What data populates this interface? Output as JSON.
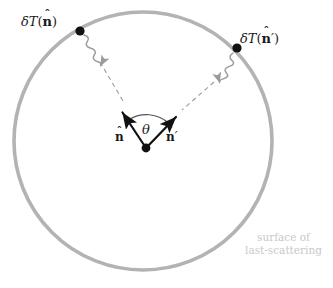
{
  "figure": {
    "background_color": "#ffffff",
    "width": 333,
    "height": 288
  },
  "colors": {
    "circle_stroke": "#b3b3b3",
    "photon_wave": "#9b9b9b",
    "dashed_line": "#9b9b9b",
    "vector_black": "#111111",
    "dot_black": "#111111",
    "caption_gray": "#c8c8c8",
    "arc_gray": "#555555"
  },
  "circle": {
    "name": "last-scattering-surface",
    "center_x": 143,
    "center_y": 141,
    "radius": 129,
    "stroke_width": 3.6
  },
  "observer": {
    "label": "observer-origin",
    "x": 146,
    "y": 148,
    "dot_radius": 4.2
  },
  "labels": {
    "delta_t_left": {
      "delta": "δ",
      "t": "T",
      "open_paren": "(",
      "vector": "n",
      "hat": "ˆ",
      "prime": "",
      "close_paren": ")"
    },
    "delta_t_right": {
      "delta": "δ",
      "t": "T",
      "open_paren": "(",
      "vector": "n",
      "hat": "ˆ",
      "prime": "′",
      "close_paren": ")"
    },
    "n_hat": {
      "vector": "n",
      "hat": "ˆ",
      "prime": ""
    },
    "n_hat_prime": {
      "vector": "n",
      "hat": "ˆ",
      "prime": "′"
    },
    "theta": "θ"
  },
  "caption": {
    "line1": "surface of",
    "line2": "last-scattering"
  },
  "points": [
    {
      "name": "scattering-point-left",
      "x": 80,
      "y": 31,
      "dot_radius": 4.4,
      "label": "δT(n̂)"
    },
    {
      "name": "scattering-point-right",
      "x": 237,
      "y": 48,
      "dot_radius": 4.4,
      "label": "δT(n̂′)"
    }
  ],
  "vectors": [
    {
      "name": "n-hat-vector",
      "from_x": 146,
      "from_y": 148,
      "to_x": 121,
      "to_y": 110,
      "label": "n̂",
      "color": "#111111"
    },
    {
      "name": "n-hat-prime-vector",
      "from_x": 146,
      "from_y": 148,
      "to_x": 178,
      "to_y": 115,
      "label": "n̂′",
      "color": "#111111"
    }
  ],
  "dashed_lines": [
    {
      "name": "sightline-left",
      "from_x": 100,
      "from_y": 62,
      "to_x": 124,
      "to_y": 103
    },
    {
      "name": "sightline-right",
      "from_x": 214,
      "from_y": 82,
      "to_x": 182,
      "to_y": 110
    }
  ],
  "photons": [
    {
      "name": "photon-wave-left",
      "from_x": 84,
      "from_y": 36,
      "to_x": 102,
      "to_y": 66,
      "direction": "inward"
    },
    {
      "name": "photon-wave-right",
      "from_x": 233,
      "from_y": 53,
      "to_x": 210,
      "to_y": 80,
      "direction": "inward"
    }
  ],
  "angle_arc": {
    "name": "theta-arc",
    "center_x": 146,
    "center_y": 148,
    "radius": 33,
    "start_angle_deg": 236,
    "end_angle_deg": 314,
    "label": "θ"
  }
}
